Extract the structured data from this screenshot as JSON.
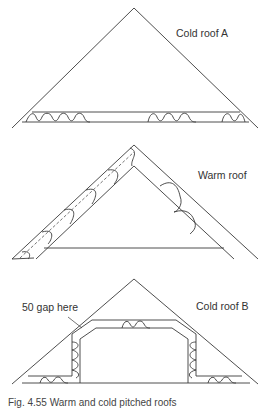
{
  "diagrams": [
    {
      "id": "cold-roof-a",
      "label": "Cold roof A"
    },
    {
      "id": "warm-roof",
      "label": "Warm roof"
    },
    {
      "id": "cold-roof-b",
      "label": "Cold roof B",
      "annotation": "50 gap here"
    }
  ],
  "caption": "Fig. 4.55 Warm and cold pitched roofs",
  "colors": {
    "line": "#3a3a3a",
    "text": "#333333",
    "background": "#ffffff"
  }
}
